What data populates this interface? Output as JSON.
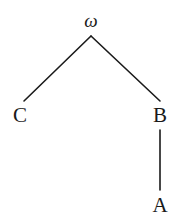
{
  "diagram": {
    "type": "tree",
    "root": {
      "id": "omega",
      "label": "ω"
    },
    "nodes": [
      {
        "id": "omega",
        "label": "ω"
      },
      {
        "id": "C",
        "label": "C"
      },
      {
        "id": "B",
        "label": "B"
      },
      {
        "id": "A",
        "label": "A"
      }
    ],
    "edges": [
      {
        "from": "omega",
        "to": "C"
      },
      {
        "from": "omega",
        "to": "B"
      },
      {
        "from": "B",
        "to": "A"
      }
    ],
    "colors": {
      "ink": "#1a1a1a",
      "background": "#ffffff"
    }
  }
}
